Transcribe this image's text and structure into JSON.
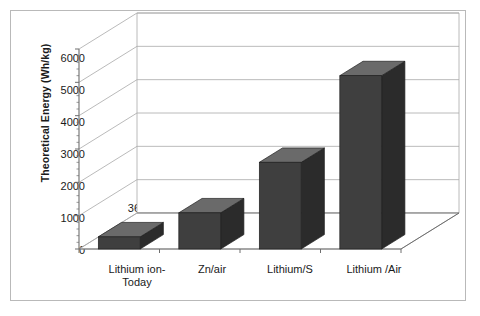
{
  "chart_data": {
    "type": "bar",
    "title": "",
    "subtitle": "",
    "xlabel": "",
    "ylabel": "Theoretical Energy (Wh/kg)",
    "categories": [
      "Lithium ion-\nToday",
      "Zn/air",
      "Lithium/S",
      "Lithium /Air"
    ],
    "values": [
      365,
      1085,
      2600,
      5200
    ],
    "data_labels": [
      "365",
      "1085",
      "2600",
      "5200"
    ],
    "ylim": [
      0,
      6000
    ],
    "yticks": [
      0,
      1000,
      2000,
      3000,
      4000,
      5000,
      6000
    ],
    "ytick_labels": [
      "0",
      "1000",
      "2000",
      "3000",
      "4000",
      "5000",
      "6000"
    ],
    "grid": true,
    "legend": "none",
    "style": "3d-column",
    "series": [
      {
        "name": "Theoretical Energy",
        "values": [
          365,
          1085,
          2600,
          5200
        ]
      }
    ],
    "colors": {
      "bar_front": "#3f3f3f",
      "bar_top": "#6a6a6a",
      "bar_side": "#2b2b2b",
      "gridline": "#a8a8a8",
      "axis": "#6e6e6e",
      "frame": "#b9b9b9",
      "text": "#1a1a1a",
      "background": "#ffffff"
    }
  }
}
